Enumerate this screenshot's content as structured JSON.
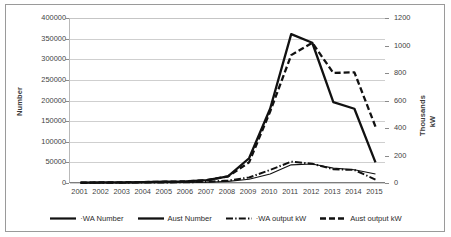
{
  "chart_data": {
    "type": "line",
    "title": "",
    "xlabel": "",
    "ylabel": "Number",
    "y2label": "Thousands kW",
    "grid": true,
    "legend_position": "bottom",
    "categories": [
      "2001",
      "2002",
      "2003",
      "2004",
      "2005",
      "2006",
      "2007",
      "2008",
      "2009",
      "2010",
      "2011",
      "2012",
      "2013",
      "2014",
      "2015"
    ],
    "ylim": [
      0,
      400000
    ],
    "ytick_values": [
      0,
      50000,
      100000,
      150000,
      200000,
      250000,
      300000,
      350000,
      400000
    ],
    "y2lim": [
      0,
      1200
    ],
    "y2tick_values": [
      0,
      200,
      400,
      600,
      800,
      1000,
      1200
    ],
    "series": [
      {
        "name": "WA Number",
        "axis": "left",
        "style": "solid-thin-dotted",
        "values": [
          300,
          400,
          500,
          700,
          900,
          1200,
          2000,
          4000,
          9000,
          22000,
          44000,
          46000,
          36000,
          32000,
          22000
        ]
      },
      {
        "name": "Aust Number",
        "axis": "left",
        "style": "solid-thick",
        "values": [
          1000,
          1300,
          1700,
          2200,
          3000,
          4000,
          7000,
          16000,
          60000,
          180000,
          361000,
          340000,
          196000,
          180000,
          50000
        ]
      },
      {
        "name": "WA output kW",
        "axis": "right",
        "style": "solid-dotted",
        "values": [
          1,
          2,
          2,
          3,
          4,
          5,
          8,
          18,
          40,
          95,
          155,
          140,
          100,
          95,
          25
        ]
      },
      {
        "name": "Aust output kW",
        "axis": "right",
        "style": "dashed",
        "values": [
          3,
          4,
          5,
          7,
          9,
          12,
          20,
          48,
          150,
          520,
          930,
          1020,
          800,
          805,
          410
        ]
      }
    ]
  },
  "axes": {
    "left": {
      "title": "Number",
      "ticks": [
        "400000",
        "350000",
        "300000",
        "250000",
        "200000",
        "150000",
        "100000",
        "50000",
        "0"
      ]
    },
    "right": {
      "title_thousands": "Thousands",
      "title_unit": "kW",
      "ticks": [
        "1200",
        "1000",
        "800",
        "600",
        "400",
        "200",
        "0"
      ]
    },
    "x": {
      "ticks": [
        "2001",
        "2002",
        "2003",
        "2004",
        "2005",
        "2006",
        "2007",
        "2008",
        "2009",
        "2010",
        "2011",
        "2012",
        "2013",
        "2014",
        "2015"
      ]
    }
  },
  "legend": {
    "items": [
      {
        "label": "·WA Number",
        "style": "solid-thin-dotted"
      },
      {
        "label": "Aust Number",
        "style": "solid-thick"
      },
      {
        "label": "·WA output kW",
        "style": "solid-dotted"
      },
      {
        "label": "Aust output kW",
        "style": "dashed"
      }
    ]
  },
  "colors": {
    "line": "#111111",
    "grid": "#cfcfcf",
    "axis": "#7d7d7d",
    "text": "#2b2b2b",
    "background": "#ffffff",
    "border": "#9a9a9a"
  }
}
